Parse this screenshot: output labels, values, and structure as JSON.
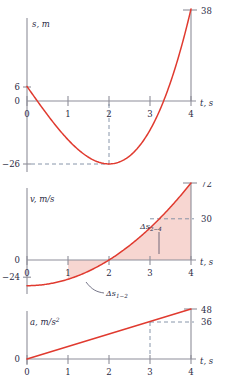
{
  "figure": {
    "kind": "kinematics-motion-graphs",
    "panels": [
      {
        "id": "s-t",
        "axis": {
          "y_label": "s, m",
          "x_label": "t, s"
        },
        "x_ticks": [
          "0",
          "1",
          "2",
          "3",
          "4"
        ],
        "y_ticks": [
          "0",
          "6",
          "-26"
        ],
        "callouts": [
          "38"
        ]
      },
      {
        "id": "v-t",
        "axis": {
          "y_label": "v, m/s",
          "x_label": "t, s"
        },
        "x_ticks": [
          "0",
          "1",
          "2",
          "3",
          "4"
        ],
        "y_ticks": [
          "0",
          "-24"
        ],
        "callouts": [
          "72",
          "30"
        ],
        "annotations": [
          {
            "delta": "Δs",
            "sub": "1–2"
          },
          {
            "delta": "Δs",
            "sub": "2–4"
          }
        ]
      },
      {
        "id": "a-t",
        "axis": {
          "y_label": "a, m/s²",
          "x_label": "t, s"
        },
        "x_ticks": [
          "0",
          "1",
          "2",
          "3",
          "4"
        ],
        "y_ticks": [
          "0"
        ],
        "callouts": [
          "48",
          "36"
        ]
      }
    ],
    "colors": {
      "curve": "#e03a2f",
      "axis": "#8e8e99",
      "shade": "#f6cfc9",
      "dash": "#7b8aa0",
      "text": "#2a2a44"
    }
  },
  "chart_data": [
    {
      "type": "line",
      "id": "displacement",
      "title": "",
      "xlabel": "t, s",
      "ylabel": "s, m",
      "xlim": [
        0,
        4
      ],
      "ylim": [
        -26,
        38
      ],
      "xticks": [
        0,
        1,
        2,
        3,
        4
      ],
      "yticks": [
        -26,
        0,
        6
      ],
      "grid": false,
      "legend": null,
      "equation": "s = 2t^3 - 24t + 6",
      "x": [
        0,
        0.25,
        0.5,
        0.75,
        1,
        1.25,
        1.5,
        1.75,
        2,
        2.25,
        2.5,
        2.75,
        3,
        3.25,
        3.5,
        3.75,
        4
      ],
      "values": [
        6,
        0.03,
        -5.75,
        -11.16,
        -16,
        -20.09,
        -23.25,
        -19.81,
        -26,
        -23.19,
        -22.75,
        -11.16,
        0,
        -4.38,
        7.75,
        21.94,
        38
      ],
      "annotations": [
        {
          "text": "38",
          "x": 4,
          "y": 38
        },
        {
          "text": "6",
          "x": 0,
          "y": 6
        },
        {
          "text": "-26",
          "x": 2,
          "y": -26
        }
      ]
    },
    {
      "type": "area",
      "id": "velocity",
      "title": "",
      "xlabel": "t, s",
      "ylabel": "v, m/s",
      "xlim": [
        0,
        4
      ],
      "ylim": [
        -24,
        72
      ],
      "xticks": [
        0,
        1,
        2,
        3,
        4
      ],
      "yticks": [
        -24,
        0
      ],
      "grid": false,
      "legend": null,
      "equation": "v = 6t^2 - 24",
      "x": [
        0,
        0.5,
        1,
        1.5,
        2,
        2.5,
        3,
        3.5,
        4
      ],
      "values": [
        -24,
        -22.5,
        -18,
        -10.5,
        0,
        13.5,
        30,
        49.5,
        72
      ],
      "shaded_regions": [
        {
          "label": "Δs1-2",
          "x_from": 1,
          "x_to": 2
        },
        {
          "label": "Δs2-4",
          "x_from": 2,
          "x_to": 4
        }
      ],
      "annotations": [
        {
          "text": "72",
          "x": 4,
          "y": 72
        },
        {
          "text": "30",
          "x": 3,
          "y": 30
        },
        {
          "text": "-24",
          "x": 0,
          "y": -24
        }
      ]
    },
    {
      "type": "line",
      "id": "acceleration",
      "title": "",
      "xlabel": "t, s",
      "ylabel": "a, m/s²",
      "xlim": [
        0,
        4
      ],
      "ylim": [
        0,
        48
      ],
      "xticks": [
        0,
        1,
        2,
        3,
        4
      ],
      "yticks": [
        0
      ],
      "grid": false,
      "legend": null,
      "equation": "a = 12t",
      "x": [
        0,
        1,
        2,
        3,
        4
      ],
      "values": [
        0,
        12,
        24,
        36,
        48
      ],
      "annotations": [
        {
          "text": "48",
          "x": 4,
          "y": 48
        },
        {
          "text": "36",
          "x": 3,
          "y": 36
        }
      ]
    }
  ]
}
